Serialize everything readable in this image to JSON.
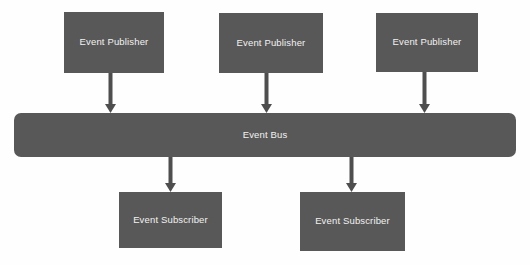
{
  "diagram": {
    "background_color": "#fefefe",
    "node_fill_color": "#585858",
    "node_text_color": "#f2f2f2",
    "arrow_color": "#4e4e4e",
    "publishers": [
      {
        "label": "Event Publisher",
        "x": 64,
        "y": 12,
        "w": 100,
        "h": 61
      },
      {
        "label": "Event Publisher",
        "x": 219,
        "y": 13,
        "w": 104,
        "h": 60
      },
      {
        "label": "Event Publisher",
        "x": 376,
        "y": 13,
        "w": 102,
        "h": 59
      }
    ],
    "bus": {
      "label": "Event Bus",
      "x": 14,
      "y": 113,
      "w": 502,
      "h": 44
    },
    "subscribers": [
      {
        "label": "Event Subscriber",
        "x": 119,
        "y": 192,
        "w": 103,
        "h": 56
      },
      {
        "label": "Event Subscriber",
        "x": 300,
        "y": 192,
        "w": 105,
        "h": 59
      }
    ],
    "publisher_arrows": [
      {
        "name": "arrow-publisher-1-to-bus",
        "x": 110,
        "y_start": 73,
        "y_end": 113
      },
      {
        "name": "arrow-publisher-2-to-bus",
        "x": 266,
        "y_start": 73,
        "y_end": 113
      },
      {
        "name": "arrow-publisher-3-to-bus",
        "x": 424,
        "y_start": 72,
        "y_end": 113
      }
    ],
    "subscriber_arrows": [
      {
        "name": "arrow-bus-to-subscriber-1",
        "x": 170,
        "y_start": 157,
        "y_end": 192
      },
      {
        "name": "arrow-bus-to-subscriber-2",
        "x": 351,
        "y_start": 157,
        "y_end": 192
      }
    ]
  }
}
